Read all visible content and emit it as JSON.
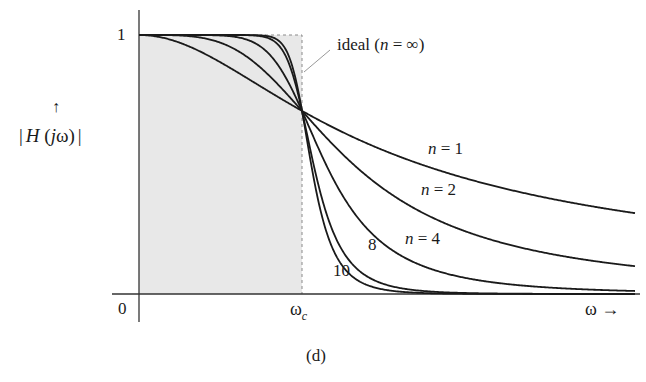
{
  "chart_data": {
    "type": "line",
    "title": "",
    "caption": "(d)",
    "xlabel": "ω →",
    "ylabel": "|H(jω)|",
    "ylabel_arrow": "↑",
    "x_ticks": [
      {
        "label": "0",
        "value": 0
      },
      {
        "label": "ω",
        "subscript": "c",
        "value": 1
      }
    ],
    "y_ticks": [
      {
        "label": "1",
        "value": 1
      }
    ],
    "x_range_normalized": [
      0,
      3.05
    ],
    "ylim": [
      0,
      1
    ],
    "grid": false,
    "crossover_value": 0.707,
    "series": [
      {
        "name": "n = 1",
        "n": 1,
        "label": "n = 1",
        "value_at_end": 0.31
      },
      {
        "name": "n = 2",
        "n": 2,
        "label": "n = 2",
        "value_at_end": 0.11
      },
      {
        "name": "n = 4",
        "n": 4,
        "label": "n = 4",
        "value_at_end": 0.01
      },
      {
        "name": "n = 8",
        "n": 8,
        "label": "8",
        "value_at_end": 0.0
      },
      {
        "name": "n = 10",
        "n": 10,
        "label": "10",
        "value_at_end": 0.0
      }
    ],
    "ideal": {
      "label": "ideal (n = ∞)",
      "passband": [
        0,
        1
      ],
      "value": 1,
      "shaded": true
    },
    "colors": {
      "curve": "#1a1a1a",
      "shade": "#e6e6e6",
      "dashed": "#888888",
      "axis": "#333333"
    }
  },
  "labels": {
    "y_one": "1",
    "origin": "0",
    "omega_c_main": "ω",
    "omega_c_sub": "c",
    "x_axis": "ω →",
    "y_arrow": "↑",
    "y_axis_pre": "|",
    "y_axis_H": "H",
    "y_axis_mid": " (",
    "y_axis_j": "j",
    "y_axis_w": "ω)",
    "y_axis_post": "|",
    "ideal_pre": "ideal (",
    "ideal_n": "n",
    "ideal_post": " = ∞)",
    "n1_n": "n",
    "n1_rest": " = 1",
    "n2_n": "n",
    "n2_rest": " = 2",
    "n4_n": "n",
    "n4_rest": " = 4",
    "n8": "8",
    "n10": "10",
    "caption": "(d)"
  }
}
